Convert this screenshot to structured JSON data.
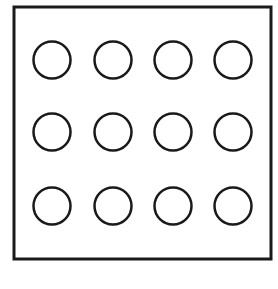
{
  "figure": {
    "canvas": {
      "width": 278,
      "height": 289,
      "background": "#ffffff"
    },
    "frame": {
      "name": "outer-rectangle",
      "x": 14,
      "y": 7,
      "width": 257,
      "height": 252,
      "stroke": "#1a1a1a",
      "stroke_width": 3,
      "fill": "none"
    },
    "grid": {
      "rows": 3,
      "columns": 4,
      "count": 12,
      "circle": {
        "radius": 18.5,
        "stroke": "#1a1a1a",
        "stroke_width": 2.5,
        "fill": "none"
      },
      "column_centers_x": [
        52,
        113,
        173,
        233
      ],
      "row_centers_y": [
        60,
        132,
        206
      ],
      "circles": [
        {
          "id": "circle-r1-c1",
          "row": 1,
          "col": 1,
          "cx": 52,
          "cy": 60,
          "r": 18.5
        },
        {
          "id": "circle-r1-c2",
          "row": 1,
          "col": 2,
          "cx": 113,
          "cy": 60,
          "r": 18.5
        },
        {
          "id": "circle-r1-c3",
          "row": 1,
          "col": 3,
          "cx": 173,
          "cy": 60,
          "r": 18.5
        },
        {
          "id": "circle-r1-c4",
          "row": 1,
          "col": 4,
          "cx": 233,
          "cy": 60,
          "r": 18.5
        },
        {
          "id": "circle-r2-c1",
          "row": 2,
          "col": 1,
          "cx": 52,
          "cy": 132,
          "r": 18.5
        },
        {
          "id": "circle-r2-c2",
          "row": 2,
          "col": 2,
          "cx": 113,
          "cy": 132,
          "r": 18.5
        },
        {
          "id": "circle-r2-c3",
          "row": 2,
          "col": 3,
          "cx": 173,
          "cy": 132,
          "r": 18.5
        },
        {
          "id": "circle-r2-c4",
          "row": 2,
          "col": 4,
          "cx": 233,
          "cy": 132,
          "r": 18.5
        },
        {
          "id": "circle-r3-c1",
          "row": 3,
          "col": 1,
          "cx": 52,
          "cy": 206,
          "r": 18.5
        },
        {
          "id": "circle-r3-c2",
          "row": 3,
          "col": 2,
          "cx": 113,
          "cy": 206,
          "r": 18.5
        },
        {
          "id": "circle-r3-c3",
          "row": 3,
          "col": 3,
          "cx": 173,
          "cy": 206,
          "r": 18.5
        },
        {
          "id": "circle-r3-c4",
          "row": 3,
          "col": 4,
          "cx": 233,
          "cy": 206,
          "r": 18.5
        }
      ]
    }
  }
}
